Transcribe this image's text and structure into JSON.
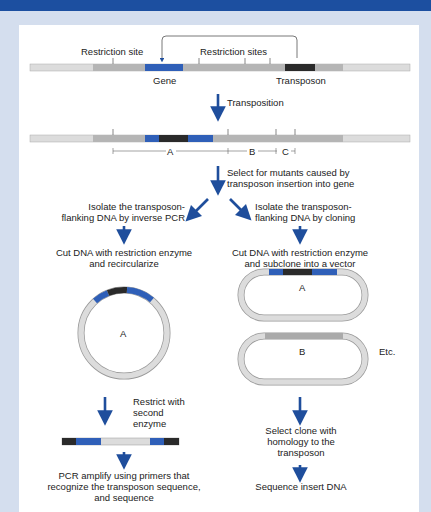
{
  "header": {
    "title_visible": ""
  },
  "colors": {
    "banner": "#1c4fa0",
    "background": "#d4deee",
    "panel": "#ffffff",
    "gene_blue": "#2f5fb8",
    "transposon_black": "#2a2a2a",
    "dna_light": "#dcdcdc",
    "dna_mid": "#b5b5b5",
    "arrow_blue": "#1f4e9c"
  },
  "step1": {
    "restriction_site": "Restriction site",
    "restriction_sites": "Restriction sites",
    "gene": "Gene",
    "transposon": "Transposon"
  },
  "step2": {
    "arrow_label": "Transposition",
    "segments": [
      "A",
      "B",
      "C"
    ]
  },
  "step3": {
    "line1": "Select for mutants caused by",
    "line2": "transposon insertion into gene"
  },
  "left_branch": {
    "isolate_l1": "Isolate the transposon-",
    "isolate_l2": "flanking DNA by inverse PCR",
    "cut_l1": "Cut DNA with restriction enzyme",
    "cut_l2": "and recircularize",
    "circle_label": "A",
    "restrict_l1": "Restrict with",
    "restrict_l2": "second",
    "restrict_l3": "enzyme",
    "pcr_l1": "PCR amplify using primers that",
    "pcr_l2": "recognize the transposon sequence,",
    "pcr_l3": "and sequence"
  },
  "right_branch": {
    "isolate_l1": "Isolate the transposon-",
    "isolate_l2": "flanking DNA by cloning",
    "cut_l1": "Cut DNA with restriction enzyme",
    "cut_l2": "and subclone into a vector",
    "vector_a_label": "A",
    "vector_b_label": "B",
    "etc": "Etc.",
    "select_l1": "Select clone with",
    "select_l2": "homology to the",
    "select_l3": "transposon",
    "sequence": "Sequence insert DNA"
  }
}
